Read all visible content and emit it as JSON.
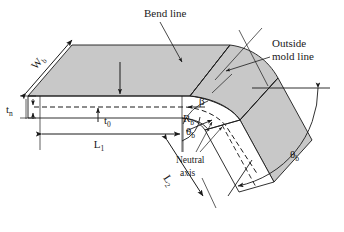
{
  "figure": {
    "type": "engineering-isometric-diagram",
    "background_color": "#ffffff",
    "surface_fill": "#c8c8c8",
    "line_color": "#1a1a1a"
  },
  "labels": {
    "bend_line": "Bend line",
    "outside_mold_line_1": "Outside",
    "outside_mold_line_2": "mold line",
    "neutral_axis_1": "Neutral",
    "neutral_axis_2": "axis",
    "width_bend": "W",
    "width_bend_sub": "b",
    "thickness_neutral": "t",
    "thickness_neutral_sub": "n",
    "thickness_zero": "t",
    "thickness_zero_sub": "0",
    "length_1": "L",
    "length_1_sub": "1",
    "length_2": "L",
    "length_2_sub": "2",
    "radius_bend": "R",
    "radius_bend_sub": "b",
    "theta_bend_inner": "θ",
    "theta_bend_inner_sub": "b",
    "theta_bend_outer": "θ",
    "theta_bend_outer_sub": "b",
    "beta": "β"
  }
}
